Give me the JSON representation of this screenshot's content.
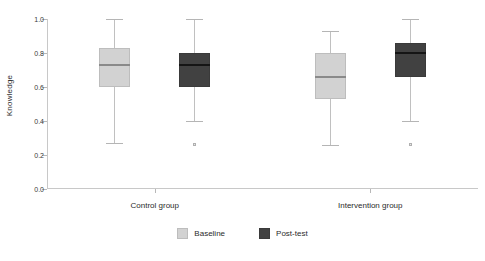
{
  "chart_data": {
    "type": "box",
    "title": "",
    "xlabel": "",
    "ylabel": "Knowledge",
    "ylim": [
      0.0,
      1.0
    ],
    "ytick_labels": [
      "0.0",
      "0.2",
      "0.4",
      "0.6",
      "0.8",
      "1.0"
    ],
    "ytick_values": [
      0.0,
      0.2,
      0.4,
      0.6,
      0.8,
      1.0
    ],
    "grid": false,
    "legend_position": "bottom-center",
    "categories": [
      "Control group",
      "Intervention group"
    ],
    "series": [
      {
        "name": "Baseline",
        "color": "#d2d2d2",
        "boxes": [
          {
            "category": "Control group",
            "whisker_low": 0.27,
            "q1": 0.6,
            "median": 0.73,
            "q3": 0.83,
            "whisker_high": 1.0,
            "outliers": []
          },
          {
            "category": "Intervention group",
            "whisker_low": 0.26,
            "q1": 0.53,
            "median": 0.66,
            "q3": 0.8,
            "whisker_high": 0.93,
            "outliers": []
          }
        ]
      },
      {
        "name": "Post-test",
        "color": "#414141",
        "boxes": [
          {
            "category": "Control group",
            "whisker_low": 0.4,
            "q1": 0.6,
            "median": 0.73,
            "q3": 0.8,
            "whisker_high": 1.0,
            "outliers": [
              0.26
            ]
          },
          {
            "category": "Intervention group",
            "whisker_low": 0.4,
            "q1": 0.66,
            "median": 0.8,
            "q3": 0.86,
            "whisker_high": 1.0,
            "outliers": [
              0.26
            ]
          }
        ]
      }
    ]
  },
  "legend": {
    "items": [
      {
        "label": "Baseline",
        "swatch": "light"
      },
      {
        "label": "Post-test",
        "swatch": "dark"
      }
    ]
  }
}
